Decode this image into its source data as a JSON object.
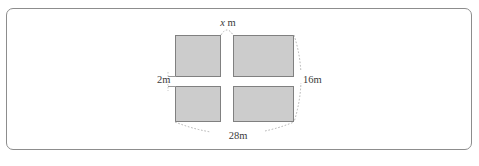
{
  "diagram": {
    "shape": "rectangle-with-cross",
    "fill_color": "#cccccc",
    "stroke_color": "#808080",
    "panel_border_color": "#8d8d8d",
    "background_color": "#ffffff",
    "labels": {
      "top": {
        "variable": "x",
        "unit": "m",
        "full": "x m"
      },
      "left": {
        "value": "2m"
      },
      "right": {
        "value": "16m"
      },
      "bottom": {
        "value": "28m"
      }
    },
    "dimensions": {
      "width_m": 28,
      "height_m": 16,
      "band_width_m": 2,
      "unknown_band_m": "x"
    },
    "quadrants": [
      {
        "name": "top-left"
      },
      {
        "name": "top-right"
      },
      {
        "name": "bottom-left"
      },
      {
        "name": "bottom-right"
      }
    ]
  }
}
